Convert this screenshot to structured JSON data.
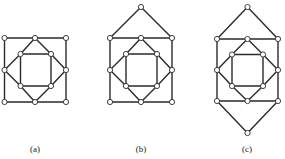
{
  "figure": {
    "colors": {
      "edge": "#2a2a2a",
      "node_fill": "#ffffff",
      "node_stroke": "#2a2a2a",
      "background": "#ffffff"
    },
    "node_radius": 2.6,
    "panels": [
      {
        "id": "a",
        "label": "(a)",
        "label_pos": [
          35,
          145
        ],
        "nodes": [
          [
            4.5,
            38
          ],
          [
            35,
            38
          ],
          [
            66,
            38
          ],
          [
            66,
            70
          ],
          [
            66,
            102
          ],
          [
            35,
            102
          ],
          [
            4.5,
            102
          ],
          [
            4.5,
            70
          ],
          [
            20.5,
            54
          ],
          [
            51,
            54
          ],
          [
            51,
            86
          ],
          [
            20.5,
            86
          ]
        ],
        "edges": [
          [
            0,
            1
          ],
          [
            1,
            2
          ],
          [
            2,
            3
          ],
          [
            3,
            4
          ],
          [
            4,
            5
          ],
          [
            5,
            6
          ],
          [
            6,
            7
          ],
          [
            7,
            0
          ],
          [
            1,
            9
          ],
          [
            9,
            3
          ],
          [
            3,
            10
          ],
          [
            10,
            5
          ],
          [
            5,
            11
          ],
          [
            11,
            7
          ],
          [
            7,
            8
          ],
          [
            8,
            1
          ],
          [
            8,
            9
          ],
          [
            9,
            10
          ],
          [
            10,
            11
          ],
          [
            11,
            8
          ]
        ]
      },
      {
        "id": "b",
        "label": "(b)",
        "label_pos": [
          141,
          145
        ],
        "nodes": [
          [
            110,
            38
          ],
          [
            141,
            38
          ],
          [
            172,
            38
          ],
          [
            172,
            70
          ],
          [
            172,
            102
          ],
          [
            141,
            102
          ],
          [
            110,
            102
          ],
          [
            110,
            70
          ],
          [
            126,
            54
          ],
          [
            157,
            54
          ],
          [
            157,
            86
          ],
          [
            126,
            86
          ],
          [
            141,
            7
          ]
        ],
        "edges": [
          [
            0,
            1
          ],
          [
            1,
            2
          ],
          [
            2,
            3
          ],
          [
            3,
            4
          ],
          [
            4,
            5
          ],
          [
            5,
            6
          ],
          [
            6,
            7
          ],
          [
            7,
            0
          ],
          [
            1,
            9
          ],
          [
            9,
            3
          ],
          [
            3,
            10
          ],
          [
            10,
            5
          ],
          [
            5,
            11
          ],
          [
            11,
            7
          ],
          [
            7,
            8
          ],
          [
            8,
            1
          ],
          [
            8,
            9
          ],
          [
            9,
            10
          ],
          [
            10,
            11
          ],
          [
            11,
            8
          ],
          [
            12,
            0
          ],
          [
            12,
            2
          ]
        ]
      },
      {
        "id": "c",
        "label": "(c)",
        "label_pos": [
          247,
          145
        ],
        "nodes": [
          [
            217,
            39
          ],
          [
            247.5,
            39
          ],
          [
            278,
            39
          ],
          [
            278,
            70
          ],
          [
            278,
            101
          ],
          [
            247.5,
            101
          ],
          [
            217,
            101
          ],
          [
            217,
            70
          ],
          [
            232,
            54.5
          ],
          [
            263,
            54.5
          ],
          [
            263,
            86
          ],
          [
            232,
            86
          ],
          [
            247.5,
            7
          ],
          [
            247.5,
            133
          ]
        ],
        "edges": [
          [
            0,
            1
          ],
          [
            1,
            2
          ],
          [
            2,
            3
          ],
          [
            3,
            4
          ],
          [
            4,
            5
          ],
          [
            5,
            6
          ],
          [
            6,
            7
          ],
          [
            7,
            0
          ],
          [
            1,
            9
          ],
          [
            9,
            3
          ],
          [
            3,
            10
          ],
          [
            10,
            5
          ],
          [
            5,
            11
          ],
          [
            11,
            7
          ],
          [
            7,
            8
          ],
          [
            8,
            1
          ],
          [
            8,
            9
          ],
          [
            9,
            10
          ],
          [
            10,
            11
          ],
          [
            11,
            8
          ],
          [
            12,
            0
          ],
          [
            12,
            2
          ],
          [
            13,
            6
          ],
          [
            13,
            4
          ]
        ]
      }
    ]
  },
  "labels": {
    "a": "(a)",
    "b": "(b)",
    "c": "(c)"
  }
}
